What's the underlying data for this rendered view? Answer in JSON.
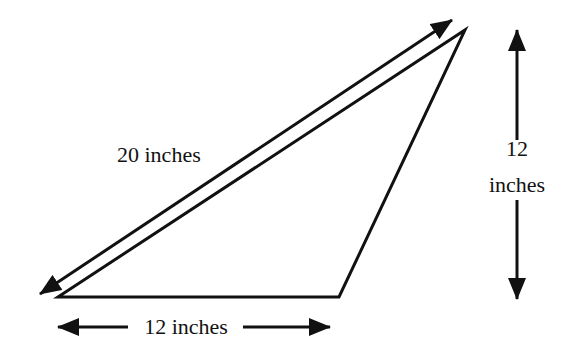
{
  "diagram": {
    "type": "triangle-with-dimensions",
    "labels": {
      "hypotenuse": "20 inches",
      "height_number": "12",
      "height_unit": "inches",
      "base": "12 inches"
    },
    "measurements": {
      "hypotenuse_inches": 20,
      "height_inches": 12,
      "base_inches": 12
    },
    "colors": {
      "stroke": "#111111",
      "background": "#ffffff"
    }
  }
}
